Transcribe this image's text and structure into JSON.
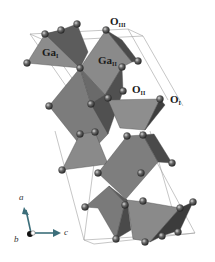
{
  "figure": {
    "type": "crystal-structure",
    "colors": {
      "background": "#ffffff",
      "polyhedron_light": "#8a8a8a",
      "polyhedron_mid": "#6e6e6e",
      "polyhedron_dark": "#3f3f3f",
      "oxygen_sphere": "#5a5a5a",
      "cell_edge": "#9a9a9a",
      "label": "#1a1a1a"
    }
  },
  "labels": {
    "ga1": {
      "main": "Ga",
      "sub": "I"
    },
    "ga2": {
      "main": "Ga",
      "sub": "II"
    },
    "o1": {
      "main": "O",
      "sub": "I"
    },
    "o2": {
      "main": "O",
      "sub": "II"
    },
    "o3": {
      "main": "O",
      "sub": "III"
    }
  },
  "axes": {
    "a": "a",
    "b": "b",
    "c": "c"
  }
}
